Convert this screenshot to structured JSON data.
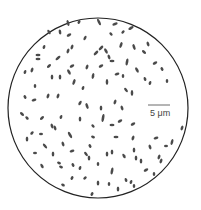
{
  "figure": {
    "scale_bar_label": "5 μm",
    "colors": {
      "outline": "#222222",
      "cells": "#4a4a4a",
      "background": "#ffffff"
    }
  }
}
